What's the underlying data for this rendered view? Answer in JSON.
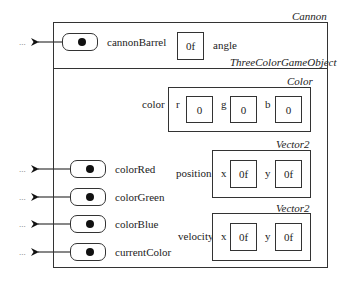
{
  "diagram": {
    "outer_object": {
      "class_label": "Cannon",
      "fields": {
        "cannonBarrel": {
          "name": "cannonBarrel",
          "kind": "reference",
          "external_target": "..."
        },
        "angle": {
          "name": "angle",
          "value": "0f"
        }
      },
      "inherited_section": {
        "class_label": "ThreeColorGameObject",
        "fields": {
          "color": {
            "name": "color",
            "type_label": "Color",
            "components": [
              {
                "name": "r",
                "value": "0"
              },
              {
                "name": "g",
                "value": "0"
              },
              {
                "name": "b",
                "value": "0"
              }
            ]
          },
          "position": {
            "name": "position",
            "type_label": "Vector2",
            "components": [
              {
                "name": "x",
                "value": "0f"
              },
              {
                "name": "y",
                "value": "0f"
              }
            ]
          },
          "velocity": {
            "name": "velocity",
            "type_label": "Vector2",
            "components": [
              {
                "name": "x",
                "value": "0f"
              },
              {
                "name": "y",
                "value": "0f"
              }
            ]
          },
          "references": [
            {
              "name": "colorRed",
              "external_target": "..."
            },
            {
              "name": "colorGreen",
              "external_target": "..."
            },
            {
              "name": "colorBlue",
              "external_target": "..."
            },
            {
              "name": "currentColor",
              "external_target": "..."
            }
          ]
        }
      }
    }
  }
}
